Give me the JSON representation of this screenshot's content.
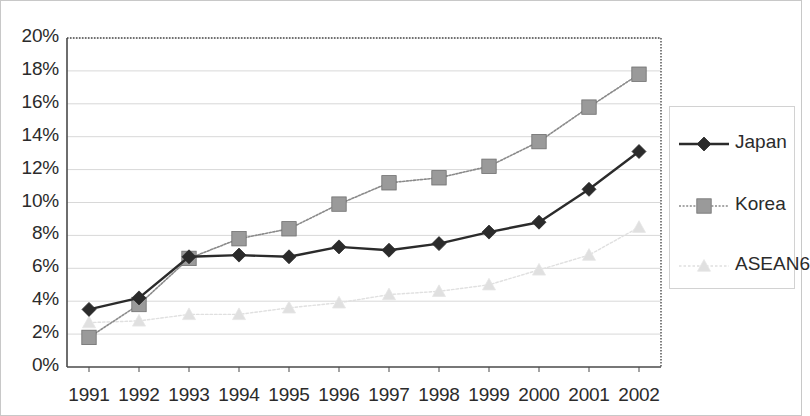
{
  "chart_data": {
    "type": "line",
    "title": "",
    "subtitle": "",
    "xlabel": "",
    "ylabel": "",
    "categories": [
      "1991",
      "1992",
      "1993",
      "1994",
      "1995",
      "1996",
      "1997",
      "1998",
      "1999",
      "2000",
      "2001",
      "2002"
    ],
    "series": [
      {
        "name": "Japan",
        "marker": "diamond",
        "color": "#2b2b2b",
        "line_style": "solid",
        "values": [
          3.5,
          4.2,
          6.7,
          6.8,
          6.7,
          7.3,
          7.1,
          7.5,
          8.2,
          8.8,
          10.8,
          13.1
        ]
      },
      {
        "name": "Korea",
        "marker": "square",
        "color": "#8a8a8a",
        "line_style": "dotted",
        "values": [
          1.8,
          3.8,
          6.6,
          7.8,
          8.4,
          9.9,
          11.2,
          11.5,
          12.2,
          13.7,
          15.8,
          17.8
        ]
      },
      {
        "name": "ASEAN6",
        "marker": "triangle",
        "color": "#e0e0e0",
        "line_style": "dotted",
        "values": [
          2.7,
          2.8,
          3.2,
          3.2,
          3.6,
          3.9,
          4.4,
          4.6,
          5.0,
          5.9,
          6.8,
          8.5
        ]
      }
    ],
    "ylim": [
      0,
      20
    ],
    "ytick_step": 2,
    "ytick_labels": [
      "0%",
      "2%",
      "4%",
      "6%",
      "8%",
      "10%",
      "12%",
      "14%",
      "16%",
      "18%",
      "20%"
    ],
    "grid": true,
    "grid_axis": "y",
    "legend_position": "right",
    "value_suffix": "%"
  },
  "colors": {
    "axis": "#4a4a4a",
    "grid": "#d8d8d8",
    "text": "#2b2b2b",
    "frame": "#c8c8c8",
    "legend_border": "#d2d2d2",
    "japan": "#2b2b2b",
    "korea": "#8a8a8a",
    "asean6": "#e0e0e0"
  }
}
